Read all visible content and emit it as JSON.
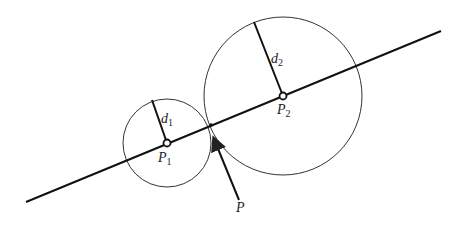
{
  "diagram": {
    "type": "geometric-construction",
    "colors": {
      "stroke": "#222222",
      "background": "#ffffff"
    },
    "line": {
      "x1": 26,
      "y1": 202,
      "x2": 441,
      "y2": 31
    },
    "circles": [
      {
        "id": "circle-1",
        "cx": 167,
        "cy": 143,
        "r": 44,
        "center_label": "P",
        "center_sub": "1",
        "radius_label": "d",
        "radius_sub": "1",
        "radius_end": {
          "x": 152,
          "y": 100
        }
      },
      {
        "id": "circle-2",
        "cx": 283,
        "cy": 96,
        "r": 79,
        "center_label": "P",
        "center_sub": "2",
        "radius_label": "d",
        "radius_sub": "2",
        "radius_end": {
          "x": 254,
          "y": 22
        }
      }
    ],
    "tangent_point": {
      "x": 211,
      "y": 125
    },
    "arrow": {
      "from": {
        "x": 239,
        "y": 200
      },
      "to": {
        "x": 214,
        "y": 139
      },
      "label": "P"
    }
  }
}
